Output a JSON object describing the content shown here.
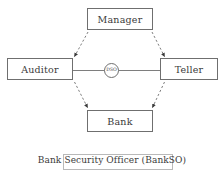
{
  "diagram": {
    "type": "hexagonal-trust-relationship-diagram",
    "nodes": [
      {
        "id": "manager",
        "label": "Manager",
        "shape": "rectangle",
        "position": "top"
      },
      {
        "id": "auditor",
        "label": "Auditor",
        "shape": "rectangle",
        "position": "left"
      },
      {
        "id": "teller",
        "label": "Teller",
        "shape": "rectangle",
        "position": "right"
      },
      {
        "id": "bank",
        "label": "Bank",
        "shape": "rectangle",
        "position": "bottom"
      },
      {
        "id": "dso",
        "label": "DSO",
        "shape": "circle",
        "position": "center"
      }
    ],
    "edges": [
      {
        "from": "manager",
        "to": "auditor",
        "style": "dashed",
        "arrow": "end"
      },
      {
        "from": "manager",
        "to": "teller",
        "style": "dashed",
        "arrow": "end"
      },
      {
        "from": "auditor",
        "to": "bank",
        "style": "dashed",
        "arrow": "end"
      },
      {
        "from": "teller",
        "to": "bank",
        "style": "dashed",
        "arrow": "end"
      },
      {
        "from": "auditor",
        "to": "teller",
        "style": "solid",
        "arrow": "none",
        "through": "dso"
      }
    ],
    "caption": "Bank Security Officer (BankSO)",
    "colors": {
      "node_border": "#6f6f6f",
      "edge": "#6f6f6f",
      "text": "#3a3a3a",
      "caption_rect_border": "#b9b9b9",
      "background": "#ffffff"
    }
  }
}
